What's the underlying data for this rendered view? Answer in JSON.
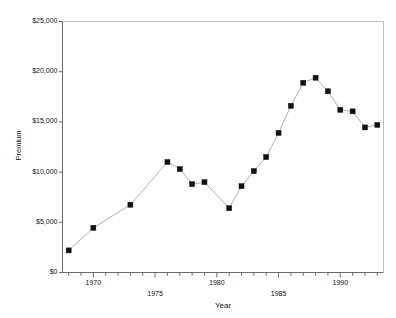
{
  "chart_data": {
    "type": "line",
    "title": "",
    "xlabel": "Year",
    "ylabel": "Premium",
    "xlim": [
      1967.5,
      1993.5
    ],
    "ylim": [
      0,
      25000
    ],
    "grid": false,
    "legend": null,
    "marker": "filled-square",
    "marker_color": "#111111",
    "line_color": "#9a9a9a",
    "frame_color": "#8c8c8c",
    "x_tick_labels": [
      "1970",
      "1975",
      "1980",
      "1985",
      "1990"
    ],
    "x_tick_label_values": [
      1970,
      1975,
      1980,
      1985,
      1990
    ],
    "x_tick_label_rows": [
      0,
      1,
      0,
      1,
      0
    ],
    "x_tick_values": [
      1968,
      1969,
      1970,
      1971,
      1972,
      1973,
      1974,
      1975,
      1976,
      1977,
      1978,
      1979,
      1980,
      1981,
      1982,
      1983,
      1984,
      1985,
      1986,
      1987,
      1988,
      1989,
      1990,
      1991,
      1992,
      1993
    ],
    "y_tick_labels": [
      "$0",
      "$5,000",
      "$10,000",
      "$15,000",
      "$20,000",
      "$25,000"
    ],
    "y_tick_values": [
      0,
      5000,
      10000,
      15000,
      20000,
      25000
    ],
    "x": [
      1968,
      1970,
      1973,
      1976,
      1977,
      1978,
      1979,
      1981,
      1982,
      1983,
      1984,
      1985,
      1986,
      1987,
      1988,
      1989,
      1990,
      1991,
      1992,
      1993
    ],
    "values": [
      2200,
      4450,
      6750,
      11000,
      10300,
      8800,
      9000,
      6400,
      8600,
      10100,
      11500,
      13900,
      16600,
      18900,
      19400,
      18050,
      16200,
      16050,
      14450,
      14700
    ]
  }
}
